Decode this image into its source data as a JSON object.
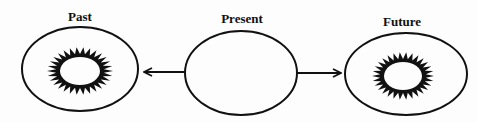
{
  "diagram": {
    "nodes": [
      {
        "id": "past",
        "label": "Past",
        "has_starburst": true
      },
      {
        "id": "present",
        "label": "Present",
        "has_starburst": false
      },
      {
        "id": "future",
        "label": "Future",
        "has_starburst": true
      }
    ],
    "edges": [
      {
        "from": "present",
        "to": "past",
        "type": "arrow"
      },
      {
        "from": "present",
        "to": "future",
        "type": "arrow"
      }
    ],
    "colors": {
      "stroke": "#111111",
      "background": "#ffffff"
    }
  }
}
